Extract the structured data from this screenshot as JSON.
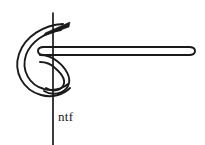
{
  "figure": {
    "background_color": "#ffffff",
    "ink_color": "#1a1a1a",
    "canvas": {
      "width": 205,
      "height": 145
    },
    "labels": [
      {
        "id": "ntf",
        "text": "ntf",
        "x": 58,
        "y": 110,
        "font_size": 13,
        "color": "#1a1a1a"
      }
    ],
    "parts": [
      {
        "name": "vertical-reference-line",
        "kind": "line",
        "x1": 53,
        "y1": 12,
        "x2": 53,
        "y2": 145,
        "stroke_width": 1.6
      },
      {
        "name": "needle-point",
        "kind": "wedge",
        "tip_x": 70,
        "tip_y": 22,
        "stroke_width": 1.6
      },
      {
        "name": "needle-body-outer-curve",
        "kind": "curve",
        "stroke_width": 1.8
      },
      {
        "name": "needle-body-inner-curve",
        "kind": "curve",
        "stroke_width": 1.8
      },
      {
        "name": "thread-loop-lower",
        "kind": "curve",
        "stroke_width": 1.8
      },
      {
        "name": "thread-horizontal-upper",
        "kind": "line",
        "x1": 40,
        "y1": 47,
        "x2": 190,
        "y2": 47,
        "stroke_width": 1.8
      },
      {
        "name": "thread-horizontal-lower",
        "kind": "line",
        "x1": 40,
        "y1": 55,
        "x2": 190,
        "y2": 55,
        "stroke_width": 1.8
      },
      {
        "name": "thread-right-tip",
        "kind": "cap",
        "x": 192,
        "y": 51,
        "stroke_width": 1.8
      }
    ]
  }
}
